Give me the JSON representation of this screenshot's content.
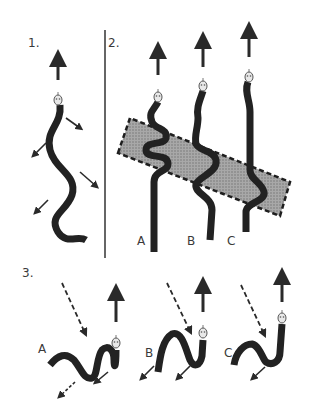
{
  "panels": [
    {
      "number": "1."
    },
    {
      "number": "2.",
      "snakes": [
        {
          "label": "A"
        },
        {
          "label": "B"
        },
        {
          "label": "C"
        }
      ]
    },
    {
      "number": "3.",
      "snakes": [
        {
          "label": "A"
        },
        {
          "label": "B"
        },
        {
          "label": "C"
        }
      ]
    }
  ],
  "colors": {
    "snake": "#222222",
    "arrow": "#2a2a2a",
    "head": "#e8e8e8",
    "patch_fill": "#9a9a9a",
    "patch_border": "#1e1e1e",
    "text": "#3a3a3a"
  }
}
